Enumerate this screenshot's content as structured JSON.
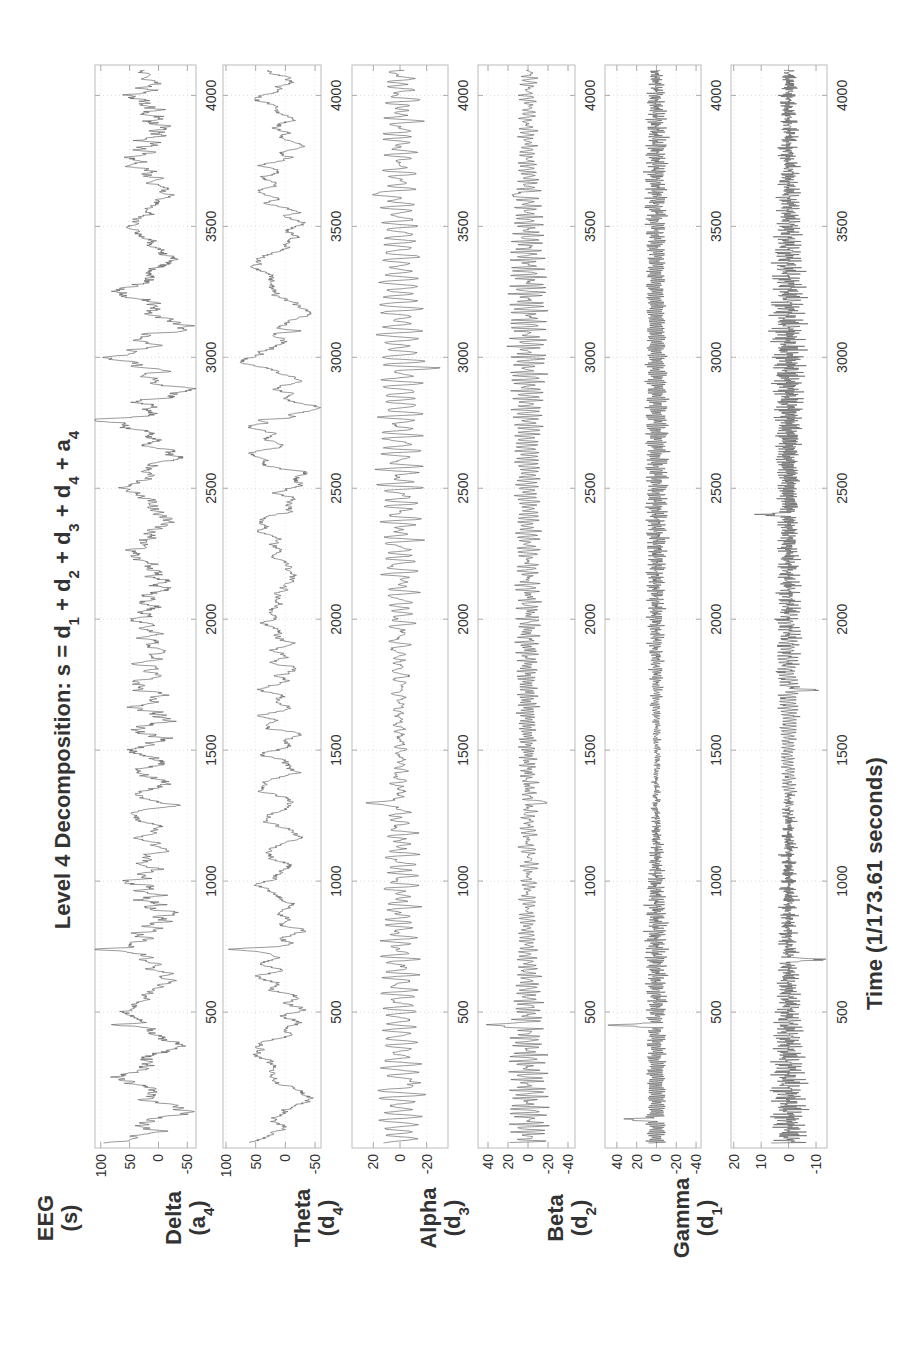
{
  "chart_data": {
    "type": "line",
    "orientation": "rotated-90-ccw",
    "title": "Level 4 Decomposition: s = d1 + d2 + d3 + d4 + a4",
    "title_parts": [
      "Level 4 Decomposition: s = d",
      "1",
      " + d",
      "2",
      " + d",
      "3",
      " + d",
      "4",
      " + a",
      "4"
    ],
    "xlabel": "Time (1/173.61 seconds)",
    "xlim": [
      0,
      4097
    ],
    "x_ticks": [
      500,
      1000,
      1500,
      2000,
      2500,
      3000,
      3500,
      4000
    ],
    "grid": true,
    "line_color": "#555555",
    "panels": [
      {
        "name": "EEG",
        "label": "EEG",
        "sub_open": "(s)",
        "sub_letter": "s",
        "sub_index": "",
        "ylim": [
          -65,
          110
        ],
        "y_ticks": [
          100,
          50,
          0,
          -50
        ],
        "amplitude": 35,
        "offset": 15,
        "components": [
          [
            0.004,
            0.9
          ],
          [
            0.012,
            0.6
          ],
          [
            0.03,
            0.35
          ],
          [
            0.08,
            0.2
          ],
          [
            0.2,
            0.12
          ]
        ],
        "spikes": [
          [
            450,
            60
          ],
          [
            740,
            70
          ],
          [
            2760,
            75
          ],
          [
            3100,
            -45
          ],
          [
            1290,
            -40
          ]
        ],
        "seed": 11
      },
      {
        "name": "Delta",
        "label": "Delta",
        "sub_letter": "a",
        "sub_index": "4",
        "ylim": [
          -60,
          105
        ],
        "y_ticks": [
          100,
          50,
          0,
          -50
        ],
        "amplitude": 32,
        "offset": 10,
        "components": [
          [
            0.003,
            0.9
          ],
          [
            0.008,
            0.7
          ],
          [
            0.02,
            0.4
          ]
        ],
        "spikes": [
          [
            740,
            60
          ],
          [
            3100,
            -40
          ],
          [
            2760,
            55
          ]
        ],
        "seed": 23
      },
      {
        "name": "Theta",
        "label": "Theta",
        "sub_letter": "d",
        "sub_index": "4",
        "ylim": [
          -36,
          36
        ],
        "y_ticks": [
          20,
          0,
          -20
        ],
        "amplitude": 10,
        "offset": 0,
        "components": [
          [
            0.035,
            1.0
          ],
          [
            0.05,
            0.6
          ],
          [
            0.025,
            0.4
          ]
        ],
        "spikes": [
          [
            230,
            -25
          ],
          [
            1300,
            32
          ],
          [
            3620,
            28
          ],
          [
            2960,
            -22
          ]
        ],
        "seed": 37
      },
      {
        "name": "Alpha",
        "label": "Alpha",
        "sub_letter": "d",
        "sub_index": "3",
        "ylim": [
          -47,
          50
        ],
        "y_ticks": [
          40,
          20,
          0,
          -20,
          -40
        ],
        "amplitude": 10,
        "offset": 0,
        "components": [
          [
            0.07,
            1.0
          ],
          [
            0.1,
            0.6
          ],
          [
            0.055,
            0.4
          ]
        ],
        "spikes": [
          [
            450,
            45
          ],
          [
            1300,
            -22
          ],
          [
            3620,
            22
          ]
        ],
        "seed": 53
      },
      {
        "name": "Beta",
        "label": "Beta",
        "sub_letter": "d",
        "sub_index": "2",
        "ylim": [
          -45,
          52
        ],
        "y_ticks": [
          40,
          20,
          0,
          -20,
          -40
        ],
        "amplitude": 7,
        "offset": 0,
        "components": [
          [
            0.14,
            1.0
          ],
          [
            0.2,
            0.7
          ],
          [
            0.11,
            0.5
          ]
        ],
        "spikes": [
          [
            450,
            45
          ],
          [
            90,
            30
          ]
        ],
        "seed": 71
      },
      {
        "name": "Gamma",
        "label": "Gamma",
        "sub_letter": "d",
        "sub_index": "1",
        "ylim": [
          -14,
          21
        ],
        "y_ticks": [
          20,
          10,
          0,
          -10
        ],
        "amplitude": 3.2,
        "offset": 0,
        "components": [
          [
            0.3,
            1.0
          ],
          [
            0.42,
            0.7
          ],
          [
            0.23,
            0.5
          ]
        ],
        "spikes": [
          [
            700,
            -12
          ],
          [
            1730,
            -9
          ],
          [
            2400,
            8
          ]
        ],
        "seed": 97
      }
    ]
  }
}
